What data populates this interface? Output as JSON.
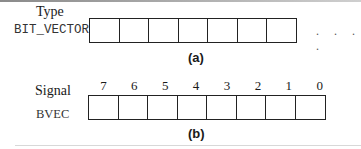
{
  "diagram": {
    "part_a": {
      "heading": "Type",
      "name": "BIT_VECTOR",
      "cell_count": 7,
      "continuation": ". . . .",
      "caption": "(a)"
    },
    "part_b": {
      "heading": "Signal",
      "name": "BVEC",
      "indices": [
        "7",
        "6",
        "5",
        "4",
        "3",
        "2",
        "1",
        "0"
      ],
      "caption": "(b)"
    }
  }
}
